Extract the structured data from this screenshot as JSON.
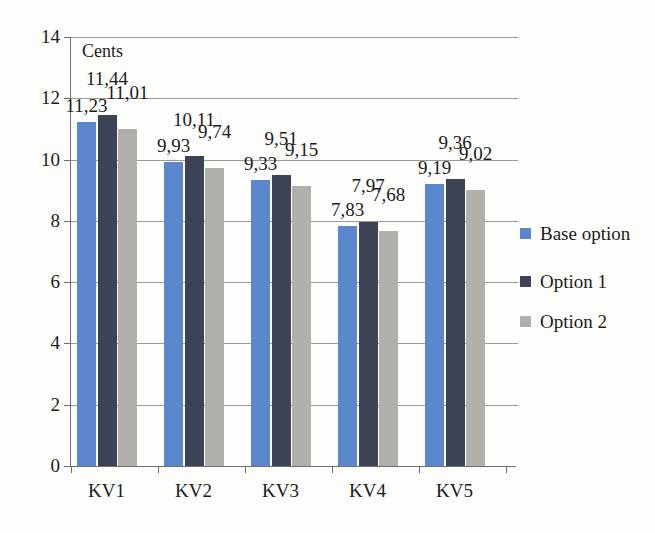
{
  "chart_data": {
    "type": "bar",
    "title": "",
    "xlabel": "",
    "ylabel": "Cents",
    "axis_title_inside": "Cents",
    "categories": [
      "KV1",
      "KV2",
      "KV3",
      "KV4",
      "KV5"
    ],
    "series": [
      {
        "name": "Base option",
        "color": "#5b87cc",
        "values": [
          11.23,
          9.93,
          9.33,
          7.83,
          9.19
        ],
        "labels": [
          "11,23",
          "9,93",
          "9,33",
          "7,83",
          "9,19"
        ]
      },
      {
        "name": "Option 1",
        "color": "#3b4355",
        "values": [
          11.44,
          10.11,
          9.51,
          7.97,
          9.36
        ],
        "labels": [
          "11,44",
          "10,11",
          "9,51",
          "7,97",
          "9,36"
        ]
      },
      {
        "name": "Option 2",
        "color": "#b2b0ab",
        "values": [
          11.01,
          9.74,
          9.15,
          7.68,
          9.02
        ],
        "labels": [
          "11,01",
          "9,74",
          "9,15",
          "7,68",
          "9,02"
        ]
      }
    ],
    "ylim": [
      0,
      14
    ],
    "yticks": [
      0,
      2,
      4,
      6,
      8,
      10,
      12,
      14
    ],
    "ytick_labels": [
      "0",
      "2",
      "4",
      "6",
      "8",
      "10",
      "12",
      "14"
    ],
    "grid": true,
    "grid_axis": "y",
    "legend_position": "right",
    "decimal_separator": ","
  },
  "legend": {
    "entries": [
      {
        "label": "Base option",
        "color": "#5b87cc"
      },
      {
        "label": "Option 1",
        "color": "#3b4355"
      },
      {
        "label": "Option 2",
        "color": "#b2b0ab"
      }
    ]
  },
  "colors": {
    "background": "#fdfdfb",
    "axis": "#6d6d6a",
    "grid": "#9a9a96",
    "text": "#1b1b1b",
    "series_base": "#5b87cc",
    "series_option1": "#3b4355",
    "series_option2": "#b2b0ab"
  }
}
